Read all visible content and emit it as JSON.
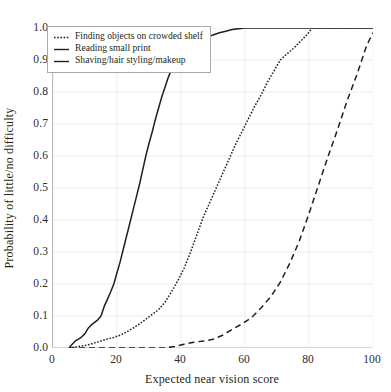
{
  "chart_data": {
    "type": "line",
    "title": "",
    "xlabel": "Expected near vision score",
    "ylabel": "Probability of little/no difficulty",
    "xlim": [
      0,
      100
    ],
    "ylim": [
      0.0,
      1.0
    ],
    "xticks": [
      0,
      20,
      40,
      60,
      80,
      100
    ],
    "yticks": [
      0.0,
      0.1,
      0.2,
      0.3,
      0.4,
      0.5,
      0.6,
      0.7,
      0.8,
      0.9,
      1.0
    ],
    "xtick_labels": [
      "0",
      "20",
      "40",
      "60",
      "80",
      "100"
    ],
    "ytick_labels": [
      "0.0",
      "0.1",
      "0.2",
      "0.3",
      "0.4",
      "0.5",
      "0.6",
      "0.7",
      "0.8",
      "0.9",
      "1.0"
    ],
    "grid": true,
    "grid_color": "#ededf0",
    "legend_position": "upper left",
    "line_color": "#231f20",
    "series": [
      {
        "name": "Finding objects on crowded shelf",
        "style": "dotted",
        "dash": "1.6,1.6",
        "x": [
          5,
          7,
          9,
          11,
          13,
          15,
          17,
          19,
          21,
          23,
          25,
          27,
          29,
          31,
          33,
          35,
          37,
          39,
          41,
          43,
          45,
          47,
          49,
          51,
          53,
          55,
          57,
          59,
          61,
          63,
          65,
          67,
          69,
          71,
          73,
          75,
          77,
          79,
          81,
          100
        ],
        "y": [
          0.0,
          0.003,
          0.006,
          0.01,
          0.016,
          0.022,
          0.028,
          0.033,
          0.04,
          0.05,
          0.062,
          0.075,
          0.09,
          0.105,
          0.12,
          0.143,
          0.175,
          0.21,
          0.25,
          0.3,
          0.355,
          0.41,
          0.455,
          0.5,
          0.545,
          0.59,
          0.635,
          0.675,
          0.715,
          0.755,
          0.79,
          0.83,
          0.865,
          0.9,
          0.918,
          0.935,
          0.955,
          0.975,
          1.0,
          1.0
        ]
      },
      {
        "name": "Reading small print",
        "style": "long-dashed",
        "dash": "6,4",
        "x": [
          5,
          10,
          15,
          20,
          25,
          30,
          35,
          38,
          41,
          44,
          47,
          50,
          53,
          56,
          59,
          62,
          65,
          68,
          71,
          74,
          77,
          80,
          83,
          86,
          89,
          92,
          95,
          98,
          100
        ],
        "y": [
          0.0,
          0.0,
          0.0,
          0.0,
          0.0,
          0.0,
          0.0,
          0.005,
          0.012,
          0.018,
          0.022,
          0.027,
          0.04,
          0.058,
          0.075,
          0.095,
          0.125,
          0.16,
          0.205,
          0.265,
          0.335,
          0.42,
          0.51,
          0.6,
          0.685,
          0.775,
          0.855,
          0.945,
          0.985
        ]
      },
      {
        "name": "Shaving/hair styling/makeup",
        "style": "solid",
        "dash": "",
        "x": [
          5,
          6,
          7,
          8,
          9,
          10,
          11,
          12,
          13,
          14,
          15,
          16,
          17,
          18,
          19,
          20,
          21,
          22,
          23,
          24,
          25,
          26,
          27,
          28,
          29,
          30,
          31,
          32,
          33,
          34,
          35,
          36,
          37,
          38,
          39,
          40,
          42,
          44,
          46,
          48,
          50,
          52,
          54,
          56,
          58,
          60,
          100
        ],
        "y": [
          0.0,
          0.012,
          0.022,
          0.028,
          0.035,
          0.045,
          0.062,
          0.072,
          0.08,
          0.088,
          0.1,
          0.13,
          0.152,
          0.175,
          0.2,
          0.235,
          0.27,
          0.31,
          0.35,
          0.39,
          0.43,
          0.47,
          0.51,
          0.555,
          0.6,
          0.64,
          0.675,
          0.715,
          0.75,
          0.785,
          0.815,
          0.845,
          0.87,
          0.888,
          0.9,
          0.915,
          0.935,
          0.952,
          0.965,
          0.972,
          0.978,
          0.985,
          0.99,
          0.995,
          0.998,
          1.0,
          1.0
        ]
      }
    ]
  },
  "legend": {
    "items": [
      {
        "label": "Finding objects on crowded shelf",
        "style": "dotted"
      },
      {
        "label": "Reading small print",
        "style": "long-dashed"
      },
      {
        "label": "Shaving/hair styling/makeup",
        "style": "solid"
      }
    ]
  }
}
